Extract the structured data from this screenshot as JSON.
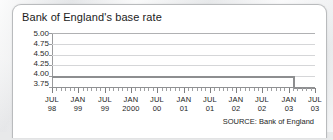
{
  "card": {
    "title": "Bank of England's base rate",
    "source_note": "SOURCE: Bank of England"
  },
  "chart_data": {
    "type": "line",
    "title": "Bank of England's base rate",
    "xlabel": "",
    "ylabel": "",
    "ylim": [
      3.75,
      5.0
    ],
    "ytick_labels": [
      "5.00",
      "4.75",
      "4.50",
      "4.25",
      "4.00",
      "3.75"
    ],
    "ytick_values": [
      5.0,
      4.75,
      4.5,
      4.25,
      4.0,
      3.75
    ],
    "grid": true,
    "legend": "none",
    "xtick_labels": [
      {
        "month": "JUL",
        "year": "98"
      },
      {
        "month": "JAN",
        "year": "99"
      },
      {
        "month": "JUL",
        "year": "99"
      },
      {
        "month": "JAN",
        "year": "2000"
      },
      {
        "month": "JUL",
        "year": "00"
      },
      {
        "month": "JAN",
        "year": "01"
      },
      {
        "month": "JUL",
        "year": "01"
      },
      {
        "month": "JAN",
        "year": "02"
      },
      {
        "month": "JUL",
        "year": "02"
      },
      {
        "month": "JAN",
        "year": "03"
      },
      {
        "month": "JUL",
        "year": "03"
      }
    ],
    "series": [
      {
        "name": "Base rate",
        "color": "#8d8e90",
        "step": true,
        "x": [
          "JUL 98",
          "JAN 03",
          "FEB 03",
          "JUL 03"
        ],
        "values": [
          4.0,
          4.0,
          3.75,
          3.75
        ]
      }
    ],
    "annotations": [
      "Rate held flat at 4.00 across the visible window, stepping down to 3.75 shortly after JAN 03"
    ]
  }
}
